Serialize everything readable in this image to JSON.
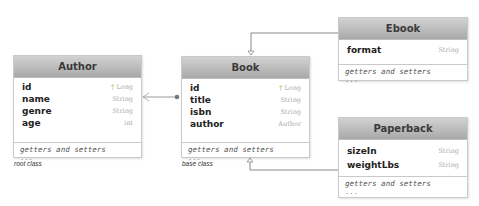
{
  "diagram": {
    "classes": {
      "author": {
        "name": "Author",
        "attributes": [
          {
            "name": "id",
            "type": "Long",
            "key": true
          },
          {
            "name": "name",
            "type": "String"
          },
          {
            "name": "genre",
            "type": "String"
          },
          {
            "name": "age",
            "type": "int"
          }
        ],
        "methods": "getters and setters",
        "more": "...",
        "caption": "root class"
      },
      "book": {
        "name": "Book",
        "attributes": [
          {
            "name": "id",
            "type": "Long",
            "key": true
          },
          {
            "name": "title",
            "type": "String"
          },
          {
            "name": "isbn",
            "type": "String"
          },
          {
            "name": "author",
            "type": "Author"
          }
        ],
        "methods": "getters and setters",
        "more": "...",
        "caption": "base class"
      },
      "ebook": {
        "name": "Ebook",
        "attributes": [
          {
            "name": "format",
            "type": "String"
          }
        ],
        "methods": "getters and setters",
        "more": "..."
      },
      "paperback": {
        "name": "Paperback",
        "attributes": [
          {
            "name": "sizeIn",
            "type": "String"
          },
          {
            "name": "weightLbs",
            "type": "String"
          }
        ],
        "methods": "getters and setters",
        "more": "..."
      }
    },
    "relations": [
      {
        "from": "Book",
        "to": "Author",
        "type": "association"
      },
      {
        "from": "Ebook",
        "to": "Book",
        "type": "inheritance"
      },
      {
        "from": "Paperback",
        "to": "Book",
        "type": "inheritance"
      }
    ],
    "colors": {
      "header_top": "#d2d2d2",
      "header_bottom": "#a9a9a9",
      "border": "#c9c9c9",
      "line": "#8a8a8a"
    }
  }
}
